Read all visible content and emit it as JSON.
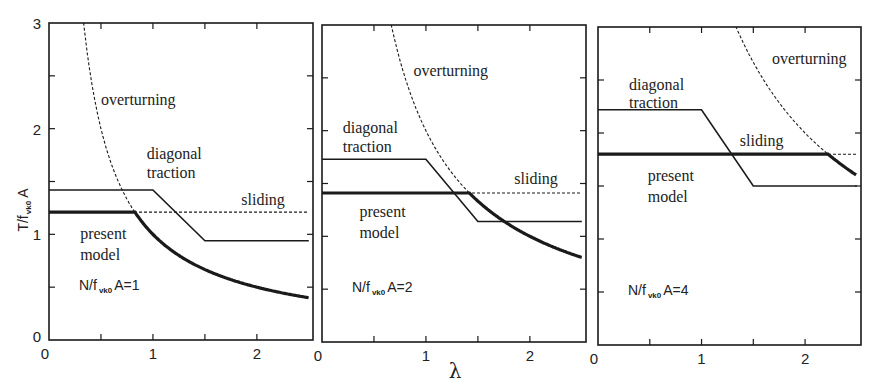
{
  "chart_data": {
    "type": "line",
    "xlabel": "λ",
    "ylabel": "T/f_vk0 A",
    "ylabel_main": "T/f",
    "ylabel_sub": "vk0",
    "ylabel_tail": " A",
    "xlim": [
      0,
      2.5
    ],
    "ylim": [
      0,
      3
    ],
    "x_ticks": [
      0,
      1,
      2
    ],
    "x_minor_ticks": [
      0.5,
      1.5
    ],
    "y_ticks": [
      0,
      1,
      2,
      3
    ],
    "y_minor_ticks": [
      0.5,
      1.5,
      2.5
    ],
    "grid": false,
    "panels": [
      {
        "param_label_main": "N/f",
        "param_label_sub": "vk0",
        "param_label_tail": "A=1",
        "N_ratio": 1,
        "series": [
          {
            "name": "overturning",
            "style": "dashed",
            "formula": "T = 1/λ",
            "x": [
              0.34,
              0.4,
              0.5,
              0.6,
              0.7,
              0.8,
              0.9,
              1.0,
              1.2,
              1.5,
              2.0,
              2.5
            ],
            "y": [
              2.94,
              2.5,
              2.0,
              1.67,
              1.43,
              1.25,
              1.11,
              1.0,
              0.83,
              0.67,
              0.5,
              0.4
            ]
          },
          {
            "name": "diagonal traction",
            "style": "thin-solid",
            "x": [
              0,
              1.0,
              1.5,
              2.5
            ],
            "y": [
              1.42,
              1.42,
              0.94,
              0.94
            ]
          },
          {
            "name": "sliding",
            "style": "dashed",
            "x": [
              0,
              2.5
            ],
            "y": [
              1.21,
              1.21
            ]
          },
          {
            "name": "present model",
            "style": "thick-solid",
            "x": [
              0,
              0.83,
              0.9,
              1.0,
              1.2,
              1.5,
              2.0,
              2.5
            ],
            "y": [
              1.21,
              1.21,
              1.11,
              1.0,
              0.83,
              0.67,
              0.5,
              0.4
            ]
          }
        ],
        "labels": [
          {
            "text": "overturning",
            "x": 0.5,
            "y": 2.22
          },
          {
            "text": "diagonal",
            "x": 0.94,
            "y": 1.71
          },
          {
            "text": "traction",
            "x": 0.94,
            "y": 1.53
          },
          {
            "text": "sliding",
            "x": 1.85,
            "y": 1.28
          },
          {
            "text": "present",
            "x": 0.3,
            "y": 0.96
          },
          {
            "text": "model",
            "x": 0.3,
            "y": 0.76
          }
        ]
      },
      {
        "param_label_main": "N/f",
        "param_label_sub": "vk0",
        "param_label_tail": "A=2",
        "N_ratio": 2,
        "series": [
          {
            "name": "overturning",
            "style": "dashed",
            "formula": "T = 2/λ",
            "x": [
              0.62,
              0.7,
              0.8,
              0.9,
              1.0,
              1.2,
              1.42,
              1.6,
              1.8,
              2.0,
              2.2,
              2.5
            ],
            "y": [
              3.0,
              2.86,
              2.5,
              2.22,
              2.0,
              1.67,
              1.41,
              1.25,
              1.11,
              1.0,
              0.91,
              0.8
            ]
          },
          {
            "name": "diagonal traction",
            "style": "thin-solid",
            "x": [
              0,
              1.0,
              1.5,
              2.5
            ],
            "y": [
              1.73,
              1.73,
              1.14,
              1.14
            ]
          },
          {
            "name": "sliding",
            "style": "dashed",
            "x": [
              0,
              2.5
            ],
            "y": [
              1.41,
              1.41
            ]
          },
          {
            "name": "present model",
            "style": "thick-solid",
            "x": [
              0,
              1.42,
              1.6,
              1.8,
              2.0,
              2.2,
              2.5
            ],
            "y": [
              1.41,
              1.41,
              1.25,
              1.11,
              1.0,
              0.91,
              0.8
            ]
          }
        ],
        "labels": [
          {
            "text": "overturning",
            "x": 0.88,
            "y": 2.52
          },
          {
            "text": "diagonal",
            "x": 0.2,
            "y": 1.98
          },
          {
            "text": "traction",
            "x": 0.2,
            "y": 1.8
          },
          {
            "text": "sliding",
            "x": 1.85,
            "y": 1.5
          },
          {
            "text": "present",
            "x": 0.36,
            "y": 1.18
          },
          {
            "text": "model",
            "x": 0.36,
            "y": 0.98
          }
        ]
      },
      {
        "param_label_main": "N/f",
        "param_label_sub": "vk0",
        "param_label_tail": "A=4",
        "N_ratio": 4,
        "series": [
          {
            "name": "overturning",
            "style": "dashed",
            "formula": "T = 4/λ",
            "x": [
              1.33,
              1.4,
              1.5,
              1.6,
              1.8,
              2.0,
              2.22,
              2.4,
              2.5
            ],
            "y": [
              3.0,
              2.86,
              2.67,
              2.5,
              2.22,
              2.0,
              1.8,
              1.67,
              1.6
            ]
          },
          {
            "name": "diagonal traction",
            "style": "thin-solid",
            "x": [
              0,
              1.0,
              1.5,
              2.5
            ],
            "y": [
              2.22,
              2.22,
              1.5,
              1.5
            ]
          },
          {
            "name": "sliding",
            "style": "dashed",
            "x": [
              0,
              2.5
            ],
            "y": [
              1.8,
              1.8
            ]
          },
          {
            "name": "present model",
            "style": "thick-solid",
            "x": [
              0,
              2.22,
              2.4,
              2.5
            ],
            "y": [
              1.8,
              1.8,
              1.67,
              1.6
            ]
          }
        ],
        "labels": [
          {
            "text": "overturning",
            "x": 1.68,
            "y": 2.65
          },
          {
            "text": "diagonal",
            "x": 0.3,
            "y": 2.41
          },
          {
            "text": "traction",
            "x": 0.3,
            "y": 2.24
          },
          {
            "text": "sliding",
            "x": 1.37,
            "y": 1.88
          },
          {
            "text": "present",
            "x": 0.48,
            "y": 1.55
          },
          {
            "text": "model",
            "x": 0.48,
            "y": 1.35
          }
        ]
      }
    ]
  },
  "colors": {
    "ink": "#1a1a1a",
    "background": "#ffffff"
  }
}
